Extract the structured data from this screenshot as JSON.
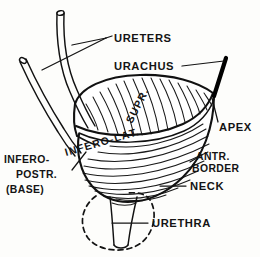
{
  "figure": {
    "background_color": "#fdfdfb",
    "ink_color": "#141414"
  },
  "labels": {
    "ureters": "URETERS",
    "urachus": "URACHUS",
    "apex": "APEX",
    "antr_border_line1": "ANTR.",
    "antr_border_line2": "BORDER",
    "neck": "NECK",
    "urethra": "URETHRA",
    "infero_postr_line1": "INFERO-",
    "infero_postr_line2": "POSTR.",
    "infero_postr_line3": "(BASE)",
    "supr_surface": "SUPR.",
    "infero_lat_surface": "INFERO-LAT."
  },
  "parts": [
    {
      "id": "ureters",
      "label": "URETERS",
      "kind": "tube-pair",
      "leader": true
    },
    {
      "id": "urachus",
      "label": "URACHUS",
      "kind": "cord",
      "leader": true
    },
    {
      "id": "apex",
      "label": "APEX",
      "kind": "landmark",
      "leader": true
    },
    {
      "id": "antr-border",
      "label": "ANTR. BORDER",
      "kind": "border",
      "leader": true
    },
    {
      "id": "neck",
      "label": "NECK",
      "kind": "landmark",
      "leader": true
    },
    {
      "id": "urethra",
      "label": "URETHRA",
      "kind": "tube",
      "leader": true
    },
    {
      "id": "infero-postr",
      "label": "INFERO-POSTR. (BASE)",
      "kind": "surface",
      "leader": true
    },
    {
      "id": "supr",
      "label": "SUPR.",
      "kind": "surface",
      "leader": false
    },
    {
      "id": "infero-lat",
      "label": "INFERO-LAT.",
      "kind": "surface",
      "leader": false
    }
  ]
}
